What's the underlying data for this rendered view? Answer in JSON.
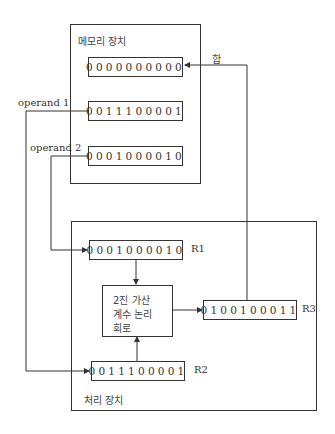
{
  "memory_unit": {
    "title": "메모리 장치",
    "registers": [
      {
        "value": "0000000000",
        "role": "sum"
      },
      {
        "value": "0011100001",
        "role": "operand 1"
      },
      {
        "value": "0001000010",
        "role": "operand 2"
      }
    ]
  },
  "processing_unit": {
    "title": "처리 장치",
    "registers": {
      "r1": {
        "name": "R1",
        "value": "0001000010"
      },
      "r2": {
        "name": "R2",
        "value": "0011100001"
      },
      "r3": {
        "name": "R3",
        "value": "0100100011"
      }
    },
    "alu": {
      "lines": [
        "2진 가산",
        "계수 논리",
        "회로"
      ]
    }
  },
  "connections": {
    "operand1_label": "operand 1",
    "operand2_label": "operand 2",
    "sum_label": "합"
  },
  "colors": {
    "line": "#333333",
    "background": "#ffffff"
  }
}
